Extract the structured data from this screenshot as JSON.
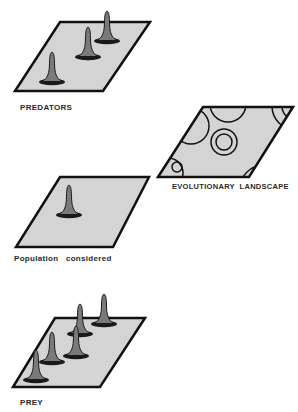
{
  "colors": {
    "plane_fill": "#d4d4d4",
    "plane_stroke": "#111111",
    "peak_fill": "#7a7a7a",
    "peak_stroke": "#1a1a1a",
    "text": "#2a2a2a"
  },
  "panels": [
    {
      "id": "predators",
      "label": "PREDATORS",
      "peak_count": 3
    },
    {
      "id": "landscape",
      "label": "EVOLUTIONARY  LANDSCAPE",
      "contour_sets": 6
    },
    {
      "id": "population",
      "label": "Population   considered",
      "peak_count": 1
    },
    {
      "id": "prey",
      "label": "PREY",
      "peak_count": 5
    }
  ]
}
